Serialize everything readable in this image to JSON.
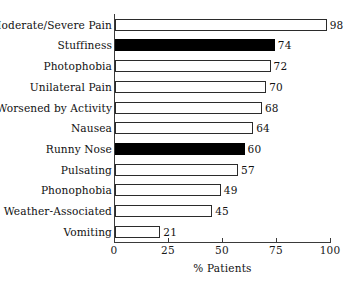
{
  "chart_data": {
    "type": "bar",
    "orientation": "horizontal",
    "title": "",
    "xlabel": "% Patients",
    "ylabel": "",
    "xlim": [
      0,
      100
    ],
    "xticks": [
      0,
      25,
      50,
      75,
      100
    ],
    "xtick_labels": [
      "0",
      "25",
      "50",
      "75",
      "100"
    ],
    "grid": false,
    "legend": null,
    "categories": [
      "Moderate/Severe Pain",
      "Stuffiness",
      "Photophobia",
      "Unilateral Pain",
      "Worsened by Activity",
      "Nausea",
      "Runny Nose",
      "Pulsating",
      "Phonophobia",
      "Weather-Associated",
      "Vomiting"
    ],
    "values": [
      98,
      74,
      72,
      70,
      68,
      64,
      60,
      57,
      49,
      45,
      21
    ],
    "value_labels": [
      "98",
      "74",
      "72",
      "70",
      "68",
      "64",
      "60",
      "57",
      "49",
      "45",
      "21"
    ],
    "bar_fill": [
      "open",
      "solid",
      "open",
      "open",
      "open",
      "open",
      "solid",
      "open",
      "open",
      "open",
      "open"
    ],
    "colors": {
      "solid_fill": "#000000",
      "open_fill": "#ffffff",
      "bar_outline": "#2b2b2b",
      "axis": "#3a3a3a",
      "text": "#111111",
      "background": "#ffffff"
    }
  }
}
